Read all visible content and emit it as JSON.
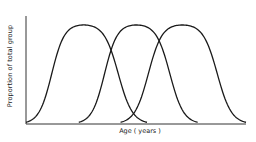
{
  "chart_data": {
    "type": "line",
    "title": "",
    "xlabel": "Age ( years )",
    "ylabel": "Proportion of total group",
    "grid": false,
    "legend": null,
    "ticks_shown": false,
    "note": "No numeric scale is shown in the image; values are approximate normalized shapes estimated from pixel positions (x in 0-100 across the axis, y in 0-1 of axis height).",
    "xlim": [
      0,
      100
    ],
    "ylim": [
      0,
      1
    ],
    "series": [
      {
        "name": "Curve 1",
        "peak_x": 26,
        "peak_y": 0.93,
        "rise_start_x": 0,
        "fall_end_x": 55
      },
      {
        "name": "Curve 2",
        "peak_x": 50,
        "peak_y": 0.93,
        "rise_start_x": 24,
        "fall_end_x": 78
      },
      {
        "name": "Curve 3",
        "peak_x": 71,
        "peak_y": 0.93,
        "rise_start_x": 43,
        "fall_end_x": 100
      }
    ],
    "colors": {
      "line": "#1a1a1a",
      "axis": "#333333",
      "background": "#ffffff"
    }
  },
  "labels": {
    "x": "Age ( years )",
    "y": "Proportion of total group"
  }
}
